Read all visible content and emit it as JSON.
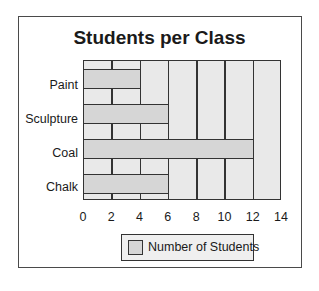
{
  "chart_data": {
    "type": "bar",
    "orientation": "horizontal",
    "title": "Students per Class",
    "categories": [
      "Paint",
      "Sculpture",
      "Coal",
      "Chalk"
    ],
    "series": [
      {
        "name": "Number of Students",
        "values": [
          4,
          6,
          12,
          6
        ]
      }
    ],
    "xlabel": "",
    "ylabel": "",
    "xlim": [
      0,
      14
    ],
    "x_ticks": [
      "0",
      "2",
      "4",
      "6",
      "8",
      "10",
      "12",
      "14"
    ],
    "grid": true,
    "legend_position": "bottom",
    "colors": {
      "bar": "#d6d6d6",
      "plot_bg": "#e9e9e9",
      "lines": "#333333"
    }
  },
  "labels": {
    "title": "Students per Class",
    "categories": [
      "Paint",
      "Sculpture",
      "Coal",
      "Chalk"
    ],
    "x_ticks": [
      "0",
      "2",
      "4",
      "6",
      "8",
      "10",
      "12",
      "14"
    ],
    "legend": "Number of Students"
  }
}
